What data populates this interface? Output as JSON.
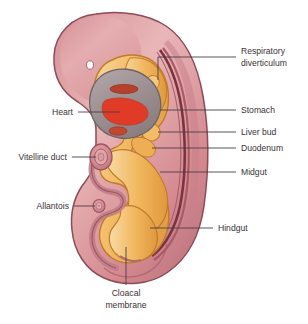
{
  "figure": {
    "background_color": "#ffffff"
  },
  "palette": {
    "body_wall_fill": "#d98f94",
    "body_wall_light": "#e7b0b2",
    "body_wall_outline": "#8e4a55",
    "gut_fill": "#f2b961",
    "gut_light": "#f8d79a",
    "gut_outline": "#c07b2e",
    "heart_fill": "#9e9194",
    "heart_outline": "#6d6265",
    "chamber_fill": "#e03b27",
    "chamber_dark": "#b5402c",
    "neural_tube": "#7a3440",
    "label_color": "#3a3236",
    "leader_color": "#4a4045",
    "eye_fill": "#ffffff"
  },
  "labels": {
    "respiratory_diverticulum": {
      "line1": "Respiratory",
      "line2": "diverticulum",
      "side": "right"
    },
    "stomach": {
      "text": "Stomach",
      "side": "right"
    },
    "liver_bud": {
      "text": "Liver bud",
      "side": "right"
    },
    "duodenum": {
      "text": "Duodenum",
      "side": "right"
    },
    "midgut": {
      "text": "Midgut",
      "side": "right"
    },
    "hindgut": {
      "text": "Hindgut",
      "side": "right"
    },
    "heart": {
      "text": "Heart",
      "side": "left"
    },
    "vitelline_duct": {
      "text": "Vitelline duct",
      "side": "left"
    },
    "allantois": {
      "text": "Allantois",
      "side": "left"
    },
    "cloacal_membrane": {
      "line1": "Cloacal",
      "line2": "membrane",
      "side": "bottom"
    }
  }
}
